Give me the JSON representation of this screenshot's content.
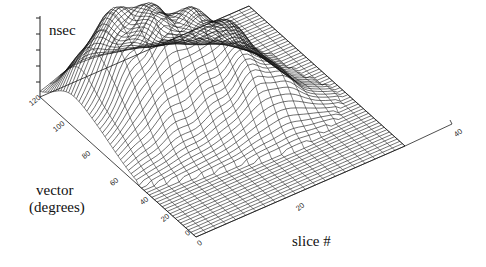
{
  "chart_data": {
    "type": "surface3d",
    "title": "",
    "zlabel": "nsec",
    "ylabel_line1": "vector",
    "ylabel_line2": "(degrees)",
    "xlabel": "slice #",
    "vector_ticks": [
      "0",
      "20",
      "40",
      "60",
      "80",
      "100",
      "120"
    ],
    "slice_ticks": [
      "0",
      "20",
      "40"
    ],
    "z_ticks": [
      "",
      "",
      "",
      "",
      ""
    ],
    "vector_range": [
      0,
      120
    ],
    "slice_range": [
      0,
      40
    ],
    "grid": true,
    "style": "wireframe mesh, black lines on white"
  }
}
